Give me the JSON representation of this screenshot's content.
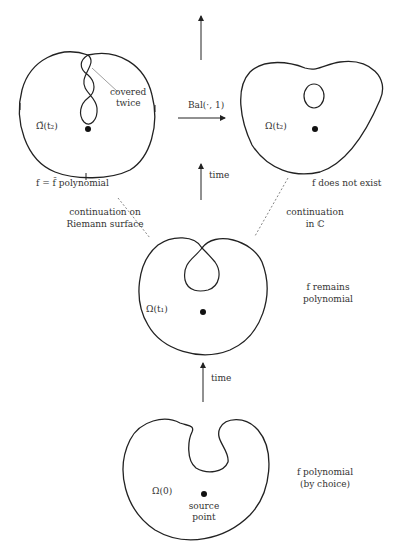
{
  "diagram": {
    "type": "flow-of-domains",
    "colors": {
      "stroke": "#222222",
      "dashed": "#777777",
      "background": "#ffffff"
    },
    "panels": {
      "top_left": {
        "domain_label": "Ω̃(t₂)",
        "annotation_line1": "covered",
        "annotation_line2": "twice",
        "caption": "f = f̃ polynomial"
      },
      "top_right": {
        "domain_label": "Ω(t₂)",
        "caption": "f does not exist"
      },
      "middle": {
        "domain_label": "Ω(t₁)",
        "caption_line1": "f remains",
        "caption_line2": "polynomial"
      },
      "bottom": {
        "domain_label": "Ω(0)",
        "point_label_line1": "source",
        "point_label_line2": "point",
        "caption_line1": "f polynomial",
        "caption_line2": "(by choice)"
      }
    },
    "arrows": {
      "horizontal_label": "Bal(·, 1)",
      "time_upper_label": "time",
      "time_lower_label": "time"
    },
    "branches": {
      "left_line1": "continuation on",
      "left_line2": "Riemann surface",
      "right_line1": "continuation",
      "right_line2": "in ℂ"
    }
  }
}
